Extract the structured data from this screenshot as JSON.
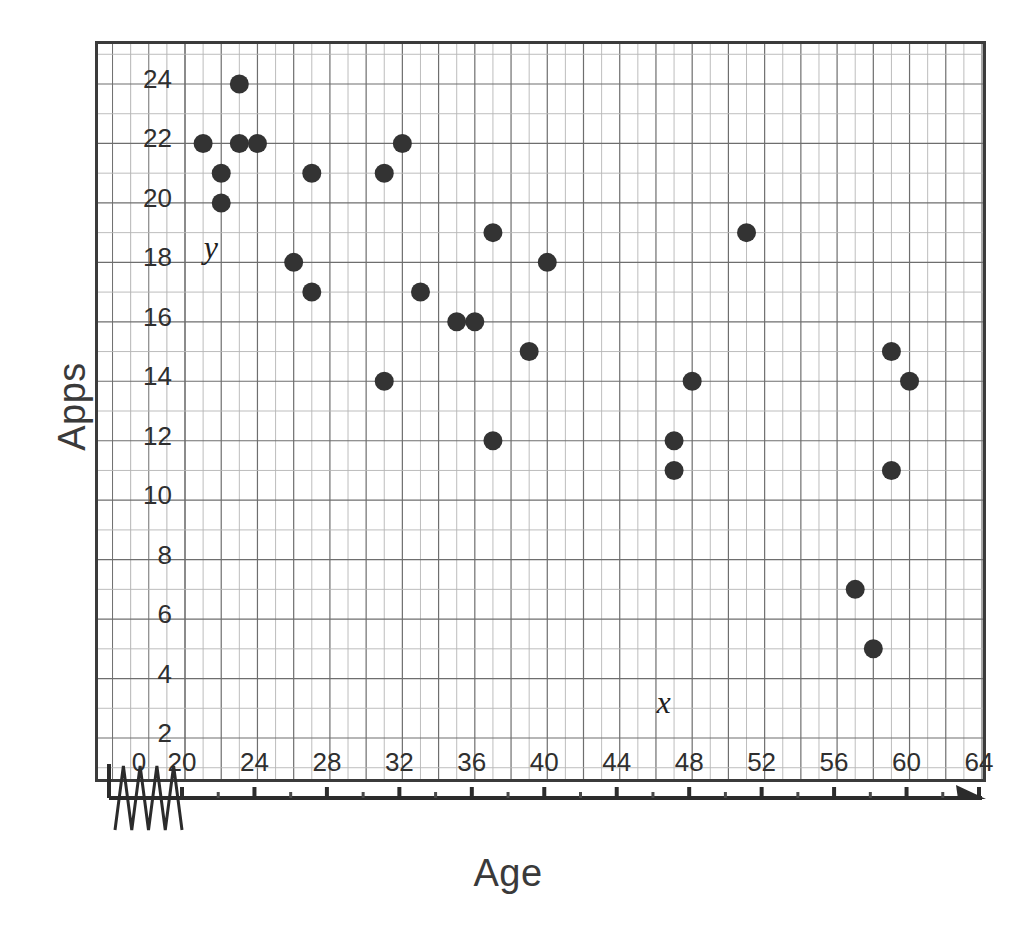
{
  "chart_data": {
    "type": "scatter",
    "title": "",
    "xlabel": "Age",
    "ylabel": "Apps",
    "xlim": [
      20,
      64
    ],
    "ylim": [
      2,
      24
    ],
    "x_ticks": [
      0,
      20,
      24,
      28,
      32,
      36,
      40,
      44,
      48,
      52,
      56,
      60,
      64
    ],
    "y_ticks": [
      2,
      4,
      6,
      8,
      10,
      12,
      14,
      16,
      18,
      20,
      22,
      24
    ],
    "x_minor_step": 2,
    "y_minor_step": 1,
    "grid": true,
    "legend": "none",
    "x_axis_break": true,
    "x_axis_arrow": true,
    "annotations": [
      {
        "text": "y",
        "x": 21.2,
        "y": 18.2,
        "style": "italic"
      },
      {
        "text": "x",
        "x": 46.2,
        "y": 2.9,
        "style": "italic"
      }
    ],
    "points": [
      {
        "x": 21,
        "y": 22
      },
      {
        "x": 22,
        "y": 21
      },
      {
        "x": 22,
        "y": 20
      },
      {
        "x": 23,
        "y": 24
      },
      {
        "x": 23,
        "y": 22
      },
      {
        "x": 24,
        "y": 22
      },
      {
        "x": 26,
        "y": 18
      },
      {
        "x": 27,
        "y": 21
      },
      {
        "x": 27,
        "y": 17
      },
      {
        "x": 31,
        "y": 21
      },
      {
        "x": 31,
        "y": 14
      },
      {
        "x": 32,
        "y": 22
      },
      {
        "x": 33,
        "y": 17
      },
      {
        "x": 35,
        "y": 16
      },
      {
        "x": 36,
        "y": 16
      },
      {
        "x": 37,
        "y": 19
      },
      {
        "x": 37,
        "y": 12
      },
      {
        "x": 39,
        "y": 15
      },
      {
        "x": 40,
        "y": 18
      },
      {
        "x": 47,
        "y": 12
      },
      {
        "x": 47,
        "y": 11
      },
      {
        "x": 48,
        "y": 14
      },
      {
        "x": 51,
        "y": 19
      },
      {
        "x": 57,
        "y": 7
      },
      {
        "x": 58,
        "y": 5
      },
      {
        "x": 59,
        "y": 15
      },
      {
        "x": 59,
        "y": 11
      },
      {
        "x": 60,
        "y": 14
      }
    ],
    "colors": {
      "marker": "#333333",
      "grid_major": "#6e6e6e",
      "grid_minor": "#b5b5b5",
      "frame": "#3b3b3b",
      "text": "#2f2f2f",
      "background": "#ffffff"
    }
  }
}
